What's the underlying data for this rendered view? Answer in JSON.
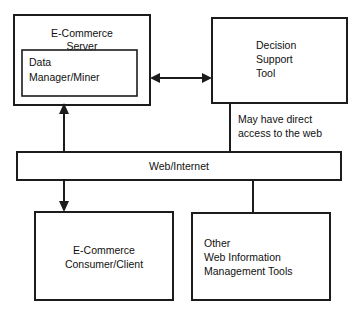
{
  "diagram": {
    "background_color": "#ffffff",
    "line_color": "#1c1c1c",
    "text_color": "#101010",
    "nodes": {
      "ecommerce_server": {
        "name": "E-Commerce Server",
        "line1": "E-Commerce",
        "line2": "Server",
        "align": "center"
      },
      "data_manager_miner": {
        "name": "Data Manager/Miner",
        "line1": "Data",
        "line2": "Manager/Miner",
        "align": "left"
      },
      "decision_support_tool": {
        "name": "Decision Support Tool",
        "line1": "Decision",
        "line2": "Support",
        "line3": "Tool",
        "align": "left"
      },
      "web_internet": {
        "name": "Web/Internet",
        "line1": "Web/Internet",
        "align": "center"
      },
      "ecommerce_client": {
        "name": "E-Commerce Consumer/Client",
        "line1": "E-Commerce",
        "line2": "Consumer/Client",
        "align": "center"
      },
      "other_web_tools": {
        "name": "Other Web Information Management Tools",
        "line1": "Other",
        "line2": "Web Information",
        "line3": "Management Tools",
        "align": "left"
      }
    },
    "annotations": {
      "direct_access": {
        "line1": "May have direct",
        "line2": "access to the web"
      }
    },
    "connectors": {
      "server_to_dst": {
        "label": "bidirectional link between E-Commerce Server and Decision Support Tool",
        "style": "double-arrow"
      },
      "dst_to_web": {
        "label": "Decision Support Tool to Web/Internet",
        "style": "plain-line"
      },
      "web_to_server": {
        "label": "Web/Internet up to E-Commerce Server",
        "style": "single-arrow-up"
      },
      "web_to_client": {
        "label": "Web/Internet down to E-Commerce Consumer/Client",
        "style": "single-arrow-down"
      },
      "web_to_other_tools": {
        "label": "Web/Internet to Other Web Information Management Tools",
        "style": "plain-line"
      }
    }
  }
}
